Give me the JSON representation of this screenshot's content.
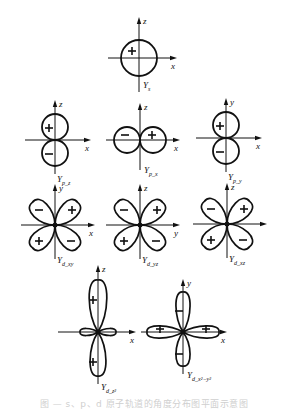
{
  "figure": {
    "caption": "图 — s、p、d 原子轨道的角度分布图平面示意图",
    "stroke_color": "#111111",
    "background": "#ffffff"
  },
  "orbitals": [
    {
      "id": "s",
      "type": "s",
      "cx": 139,
      "cy": 58,
      "axes": {
        "h": "x",
        "v": "z"
      },
      "label": "Y",
      "sub": "s",
      "signs": [
        "+"
      ]
    },
    {
      "id": "pz",
      "type": "p_v",
      "cx": 55,
      "cy": 140,
      "axes": {
        "h": "x",
        "v": "z"
      },
      "label": "Y",
      "sub": "p_z",
      "signs": [
        "+",
        "−"
      ]
    },
    {
      "id": "px",
      "type": "p_h",
      "cx": 140,
      "cy": 140,
      "axes": {
        "h": "x",
        "v": "z"
      },
      "label": "Y",
      "sub": "p_x",
      "signs": [
        "−",
        "+"
      ]
    },
    {
      "id": "py",
      "type": "p_v",
      "cx": 226,
      "cy": 138,
      "axes": {
        "h": "x",
        "v": "y"
      },
      "label": "Y",
      "sub": "p_y",
      "signs": [
        "+",
        "−"
      ]
    },
    {
      "id": "dxy",
      "type": "d_diag",
      "cx": 55,
      "cy": 225,
      "axes": {
        "h": "x",
        "v": "y"
      },
      "label": "Y",
      "sub": "d_xy",
      "signs": [
        "+",
        "−",
        "+",
        "−"
      ]
    },
    {
      "id": "dyz",
      "type": "d_diag",
      "cx": 140,
      "cy": 225,
      "axes": {
        "h": "y",
        "v": "z"
      },
      "label": "Y",
      "sub": "d_yz",
      "signs": [
        "+",
        "−",
        "+",
        "−"
      ]
    },
    {
      "id": "dxz",
      "type": "d_diag",
      "cx": 227,
      "cy": 224,
      "axes": {
        "h": "",
        "v": "z"
      },
      "label": "Y",
      "sub": "d_xz",
      "signs": [
        "+",
        "−",
        "+",
        "−"
      ]
    },
    {
      "id": "dz2",
      "type": "d_z2",
      "cx": 98,
      "cy": 332,
      "axes": {
        "h": "x",
        "v": "z"
      },
      "label": "Y",
      "sub": "d_z²",
      "signs": [
        "+",
        "+"
      ]
    },
    {
      "id": "dx2y2",
      "type": "d_axial",
      "cx": 183,
      "cy": 332,
      "axes": {
        "h": "x",
        "v": "y"
      },
      "label": "Y",
      "sub": "d_x²−y²",
      "signs": [
        "−",
        "+",
        "−",
        "+"
      ]
    }
  ]
}
